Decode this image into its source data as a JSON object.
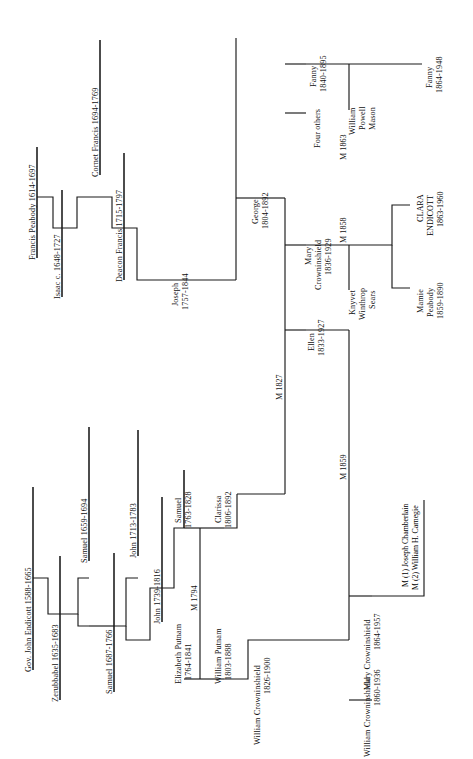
{
  "document": {
    "kind": "genealogy-chart",
    "title_visible": false,
    "orientation": "rotated-90-ccw",
    "background_color": "#ffffff",
    "line_color": "#111111"
  },
  "people": {
    "gov_john_endicott": {
      "name": "Gov. John Endicott",
      "dates": "1588-1665",
      "label": "Gov. John Endicott  1588-1665"
    },
    "zerubbabel": {
      "name": "Zerubbabel",
      "dates": "1635-1683",
      "label": "Zerubbabel  1635-1683"
    },
    "samuel_1659": {
      "name": "Samuel",
      "dates": "1659-1694",
      "label": "Samuel  1659-1694"
    },
    "samuel_1687": {
      "name": "Samuel",
      "dates": "1687-1766",
      "label": "Samuel  1687-1766"
    },
    "john_1713": {
      "name": "John",
      "dates": "1713-1783",
      "label": "John  1713-1783"
    },
    "john_1739": {
      "name": "John",
      "dates": "1739-1816",
      "label": "John  1739-1816"
    },
    "samuel_1763": {
      "name": "Samuel",
      "dates": "1763-1828",
      "line1": "Samuel",
      "line2": "1763-1828"
    },
    "elizabeth_putnam": {
      "name": "Elizabeth Putnam",
      "dates": "1764-1841",
      "line1": "Elizabeth Putnam",
      "line2": "1764-1841"
    },
    "clarissa": {
      "name": "Clarissa",
      "dates": "1806-1892",
      "line1": "Clarissa",
      "line2": "1806-1892"
    },
    "william_putnam": {
      "name": "William Putnam",
      "dates": "1803-1888",
      "line1": "William Putnam",
      "line2": "1803-1888"
    },
    "william_crowninshield_1826": {
      "name": "William Crowninshield",
      "dates": "1826-1900",
      "line1": "William Crowninshield",
      "line2": "1826-1900"
    },
    "mary_crowninshield_1864": {
      "name": "Mary Crowninshield",
      "dates": "1864-1957",
      "line1": "Mary Crowninshield",
      "line2": "1864-1957"
    },
    "william_crowninshield_1860": {
      "name": "William Crowninshield",
      "dates": "1860-1936",
      "line1": "William Crowninshield",
      "line2": "1860-1936"
    },
    "francis_peabody": {
      "name": "Francis Peabody",
      "dates": "1614-1697",
      "label": "Francis Peabody  1614-1697"
    },
    "isaac": {
      "name": "Isaac",
      "dates": "c. 1648-1727",
      "label": "Isaac  c. 1648-1727"
    },
    "cornet_francis": {
      "name": "Cornet Francis",
      "dates": "1694-1769",
      "label": "Cornet Francis  1694-1769"
    },
    "deacon_francis": {
      "name": "Deacon Francis",
      "dates": "1715-1797",
      "label": "Deacon Francis  1715-1797"
    },
    "joseph": {
      "name": "Joseph",
      "dates": "1757-1844",
      "line1": "Joseph",
      "line2": "1757-1844"
    },
    "george": {
      "name": "George",
      "dates": "1804-1892",
      "line1": "George",
      "line2": "1804-1892"
    },
    "fanny_1840": {
      "name": "Fanny",
      "dates": "1840-1895",
      "line1": "Fanny",
      "line2": "1840-1895"
    },
    "four_others": {
      "name": "Four others",
      "dates": "",
      "line1": "Four others",
      "line2": ""
    },
    "mary_crowninshield_1836": {
      "name": "Mary Crowninshield",
      "dates": "1836-1929",
      "line1": "Mary",
      "line2": "Crowninshield",
      "line3": "1836-1929"
    },
    "ellen": {
      "name": "Ellen",
      "dates": "1833-1927",
      "line1": "Ellen",
      "line2": "1833-1927"
    },
    "william_powell_mason": {
      "name": "William Powell Mason",
      "line1": "William",
      "line2": "Powell",
      "line3": "Mason"
    },
    "knyvet_winthrop_sears": {
      "name": "Knyvet Winthrop Sears",
      "line1": "Knyvet",
      "line2": "Winthrop",
      "line3": "Sears"
    },
    "fanny_1864": {
      "name": "Fanny",
      "dates": "1864-1948",
      "line1": "Fanny",
      "line2": "1864-1948"
    },
    "clara_endicott": {
      "name": "CLARA ENDICOTT",
      "dates": "1863-1960",
      "line1": "CLARA",
      "line2": "ENDICOTT",
      "line3": "1863-1960"
    },
    "mamie_peabody": {
      "name": "Mamie Peabody",
      "dates": "1859-1890",
      "line1": "Mamie",
      "line2": "Peabody",
      "line3": "1859-1890"
    }
  },
  "marriages": {
    "m1794": {
      "label": "M 1794",
      "year": "1794"
    },
    "m1827": {
      "label": "M 1827",
      "year": "1827"
    },
    "m1859": {
      "label": "M 1859",
      "year": "1859"
    },
    "m1863": {
      "label": "M 1863",
      "year": "1863"
    },
    "m1858": {
      "label": "M 1858",
      "year": "1858"
    },
    "mary_marriages": {
      "first": "M (1) Joseph Chamberlain",
      "second": "M (2) William H. Carnegie"
    }
  }
}
